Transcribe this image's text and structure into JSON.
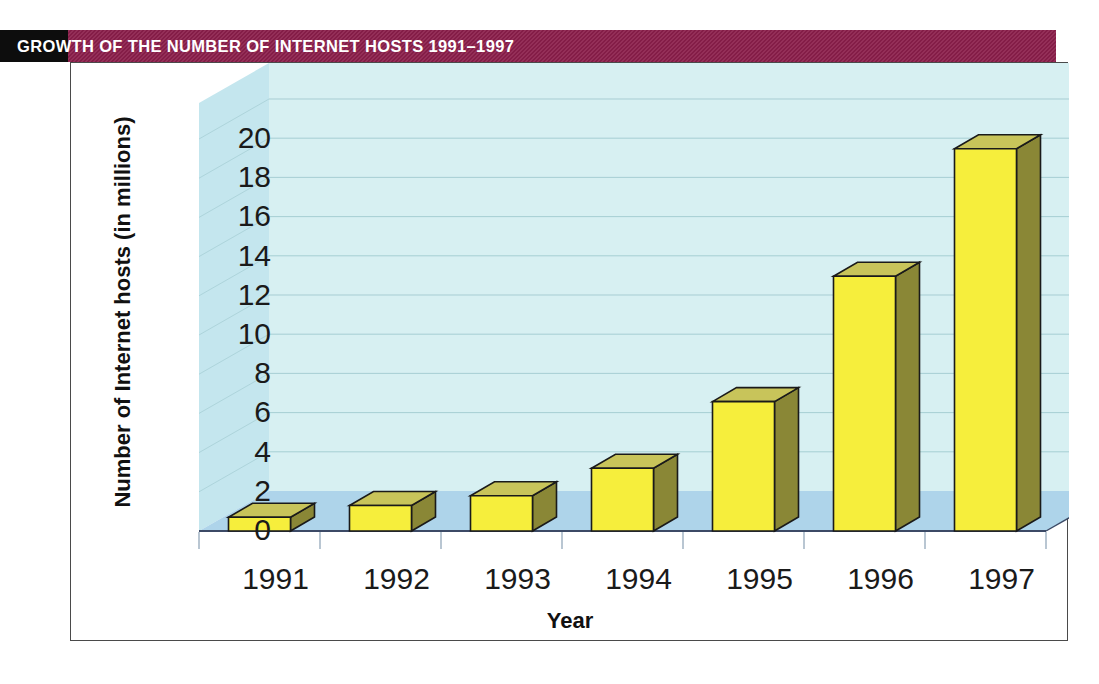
{
  "header": {
    "title": "GROWTH OF THE NUMBER OF INTERNET HOSTS 1991–1997",
    "band_color": "#8c1f4b",
    "block_color": "#0d0d0d",
    "title_color": "#ffffff"
  },
  "chart_data": {
    "type": "bar",
    "title": "GROWTH OF THE NUMBER OF INTERNET HOSTS 1991–1997",
    "subtitle": "",
    "xlabel": "Year",
    "ylabel": "Number of Internet hosts (in millions)",
    "categories": [
      "1991",
      "1992",
      "1993",
      "1994",
      "1995",
      "1996",
      "1997"
    ],
    "values": [
      0.7,
      1.3,
      1.8,
      3.2,
      6.6,
      13.0,
      19.5
    ],
    "ylim": [
      0,
      20
    ],
    "ytick_values": [
      20,
      18,
      16,
      14,
      12,
      10,
      8,
      6,
      4,
      2,
      0
    ],
    "ytick_labels": [
      "20",
      "18",
      "16",
      "14",
      "12",
      "10",
      "8",
      "6",
      "4",
      "2",
      "0"
    ],
    "ytick_step": 2,
    "grid": true,
    "legend": "none",
    "style": "3d-column",
    "colors": {
      "bar_front": "#f6ee3c",
      "bar_top": "#c8c45a",
      "bar_side": "#8a8736",
      "bar_outline": "#1a1a1a",
      "plot_back": "#d7f0f2",
      "plot_floor": "#aed4ea",
      "plot_sidewall": "#c4e6ee",
      "gridline": "#9fc9cf",
      "frame_border": "#4a4a4a"
    }
  }
}
